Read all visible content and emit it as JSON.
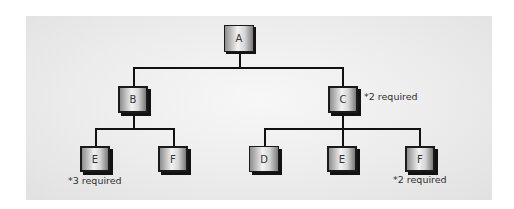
{
  "diagram": {
    "type": "tree",
    "title": "",
    "nodes": {
      "a": {
        "label": "A"
      },
      "b": {
        "label": "B"
      },
      "c": {
        "label": "C",
        "note": "*2 required"
      },
      "e_left": {
        "label": "E",
        "note": "*3 required"
      },
      "f_left": {
        "label": "F"
      },
      "d": {
        "label": "D"
      },
      "e_mid": {
        "label": "E"
      },
      "f_right": {
        "label": "F",
        "note": "*2 required"
      }
    },
    "edges": [
      [
        "A",
        "B"
      ],
      [
        "A",
        "C"
      ],
      [
        "B",
        "E"
      ],
      [
        "B",
        "F"
      ],
      [
        "C",
        "D"
      ],
      [
        "C",
        "E"
      ],
      [
        "C",
        "F"
      ]
    ],
    "colors": {
      "panel_background": "#ececec",
      "page_background": "#ffffff",
      "line": "#111111",
      "node_border": "#1a1a1a"
    }
  }
}
